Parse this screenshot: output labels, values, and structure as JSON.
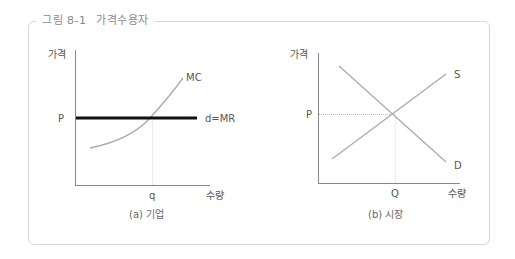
{
  "figure": {
    "title_prefix": "그림 8-1",
    "title": "가격수용자"
  },
  "panel_a": {
    "caption": "(a) 기업",
    "y_label": "가격",
    "x_label": "수량",
    "price_label": "P",
    "quantity_label": "q",
    "curve_mc": "MC",
    "curve_d": "d=MR"
  },
  "panel_b": {
    "caption": "(b) 시장",
    "y_label": "가격",
    "x_label": "수량",
    "price_label": "P",
    "quantity_label": "Q",
    "curve_s": "S",
    "curve_d": "D"
  },
  "colors": {
    "axis": "#888888",
    "curve": "#aaaaaa",
    "demand_firm": "#111111",
    "frame": "#d6d6d6"
  }
}
